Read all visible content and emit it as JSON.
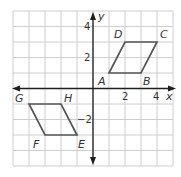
{
  "diagram": {
    "type": "coordinate-plane",
    "axes": {
      "x_label": "x",
      "y_label": "y",
      "x_range": [
        -5,
        5
      ],
      "y_range": [
        -5,
        5
      ],
      "grid": true,
      "grid_step": 1
    },
    "tick_labels": {
      "x_2": "2",
      "x_4": "4",
      "y_2": "2",
      "y_4": "4",
      "y_neg2": "−2"
    },
    "shapes": [
      {
        "name": "ABCD",
        "type": "parallelogram",
        "vertices": [
          {
            "label": "A",
            "x": 1,
            "y": 1
          },
          {
            "label": "B",
            "x": 3,
            "y": 1
          },
          {
            "label": "C",
            "x": 4,
            "y": 3
          },
          {
            "label": "D",
            "x": 2,
            "y": 3
          }
        ]
      },
      {
        "name": "EFGH",
        "type": "parallelogram",
        "vertices": [
          {
            "label": "E",
            "x": -1,
            "y": -3
          },
          {
            "label": "F",
            "x": -3,
            "y": -3
          },
          {
            "label": "G",
            "x": -4,
            "y": -1
          },
          {
            "label": "H",
            "x": -2,
            "y": -1
          }
        ]
      }
    ],
    "colors": {
      "grid": "#c8c8c8",
      "axes": "#1e1e1e",
      "shape_stroke": "#555555",
      "text": "#333333"
    }
  }
}
